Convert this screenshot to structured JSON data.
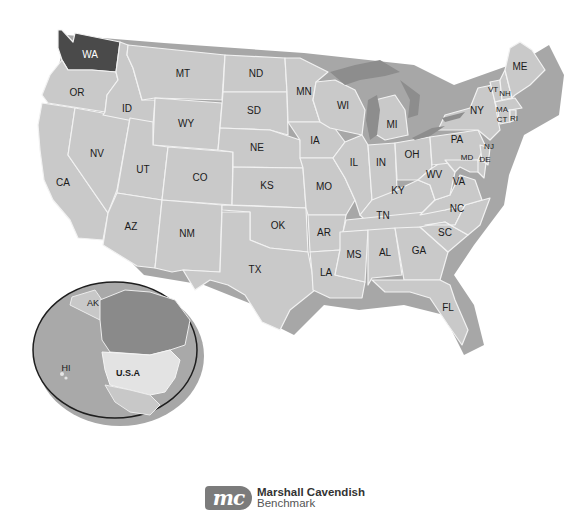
{
  "map": {
    "title": "United States of America",
    "highlighted_state": "WA",
    "colors": {
      "state_fill": "#c9c9c9",
      "highlight_fill": "#4a4a4a",
      "border": "#f2f2f2",
      "water": "#8d8d8d"
    },
    "state_labels": {
      "WA": "WA",
      "OR": "OR",
      "CA": "CA",
      "ID": "ID",
      "NV": "NV",
      "MT": "MT",
      "WY": "WY",
      "UT": "UT",
      "AZ": "AZ",
      "CO": "CO",
      "NM": "NM",
      "ND": "ND",
      "SD": "SD",
      "NE": "NE",
      "KS": "KS",
      "OK": "OK",
      "TX": "TX",
      "MN": "MN",
      "IA": "IA",
      "MO": "MO",
      "AR": "AR",
      "LA": "LA",
      "WI": "WI",
      "IL": "IL",
      "MI": "MI",
      "IN": "IN",
      "OH": "OH",
      "KY": "KY",
      "TN": "TN",
      "MS": "MS",
      "AL": "AL",
      "GA": "GA",
      "FL": "FL",
      "SC": "SC",
      "NC": "NC",
      "VA": "VA",
      "WV": "WV",
      "PA": "PA",
      "NY": "NY",
      "MD": "MD",
      "DE": "DE",
      "NJ": "NJ",
      "CT": "CT",
      "RI": "RI",
      "MA": "MA",
      "VT": "VT",
      "NH": "NH",
      "ME": "ME"
    }
  },
  "inset": {
    "labels": {
      "AK": "AK",
      "HI": "HI",
      "USA": "U.S.A"
    }
  },
  "publisher": {
    "mark": "mc",
    "name_line1": "Marshall Cavendish",
    "name_line2": "Benchmark"
  }
}
